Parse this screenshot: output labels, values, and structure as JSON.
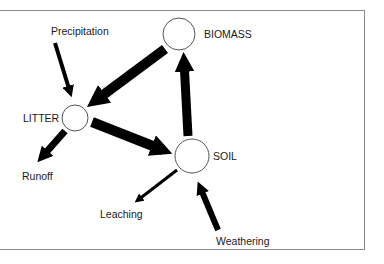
{
  "diagram": {
    "type": "compartment-flow",
    "nodes": [
      {
        "id": "biomass",
        "label": "BIOMASS"
      },
      {
        "id": "litter",
        "label": "LITTER"
      },
      {
        "id": "soil",
        "label": "SOIL"
      }
    ],
    "external_flows": [
      {
        "id": "precipitation",
        "label": "Precipitation",
        "direction": "into litter"
      },
      {
        "id": "runoff",
        "label": "Runoff",
        "direction": "out of litter"
      },
      {
        "id": "leaching",
        "label": "Leaching",
        "direction": "out of soil"
      },
      {
        "id": "weathering",
        "label": "Weathering",
        "direction": "into soil"
      }
    ],
    "internal_flows": [
      {
        "from": "biomass",
        "to": "litter",
        "weight": "heavy"
      },
      {
        "from": "litter",
        "to": "soil",
        "weight": "heavy"
      },
      {
        "from": "soil",
        "to": "biomass",
        "weight": "heavy"
      }
    ],
    "colors": {
      "arrow": "#000000",
      "node_stroke": "#555555",
      "frame": "#8a8a8a",
      "text": "#1a1a1a"
    }
  }
}
